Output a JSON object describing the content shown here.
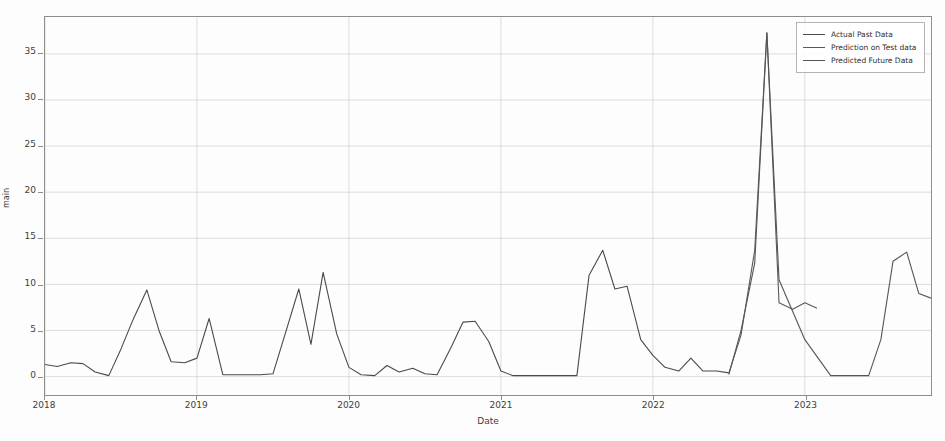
{
  "chart_data": {
    "type": "line",
    "title": "",
    "xlabel": "Date",
    "ylabel": "main",
    "xlim": [
      2018.0,
      2023.83
    ],
    "ylim": [
      -2.0,
      39.0
    ],
    "grid": true,
    "legend_position": "upper right",
    "xticks": [
      {
        "value": 2018,
        "label": "2018"
      },
      {
        "value": 2019,
        "label": "2019"
      },
      {
        "value": 2020,
        "label": "2020"
      },
      {
        "value": 2021,
        "label": "2021"
      },
      {
        "value": 2022,
        "label": "2022"
      },
      {
        "value": 2023,
        "label": "2023"
      }
    ],
    "yticks": [
      {
        "value": 0,
        "label": "0"
      },
      {
        "value": 5,
        "label": "5"
      },
      {
        "value": 10,
        "label": "10"
      },
      {
        "value": 15,
        "label": "15"
      },
      {
        "value": 20,
        "label": "20"
      },
      {
        "value": 25,
        "label": "25"
      },
      {
        "value": 30,
        "label": "30"
      },
      {
        "value": 35,
        "label": "35"
      }
    ],
    "series": [
      {
        "name": "Actual Past Data",
        "color": "#4a4a4a",
        "x": [
          2018.0,
          2018.08,
          2018.17,
          2018.25,
          2018.33,
          2018.42,
          2018.5,
          2018.58,
          2018.67,
          2018.75,
          2018.83,
          2018.92,
          2019.0,
          2019.08,
          2019.17,
          2019.25,
          2019.33,
          2019.42,
          2019.5,
          2019.58,
          2019.67,
          2019.75,
          2019.83,
          2019.92,
          2020.0,
          2020.08,
          2020.17,
          2020.25,
          2020.33,
          2020.42,
          2020.5,
          2020.58,
          2020.67,
          2020.75,
          2020.83,
          2020.92,
          2021.0,
          2021.08,
          2021.17,
          2021.25,
          2021.33,
          2021.42,
          2021.5,
          2021.58,
          2021.67,
          2021.75,
          2021.83,
          2021.92,
          2022.0,
          2022.08,
          2022.17,
          2022.25,
          2022.33,
          2022.42,
          2022.5
        ],
        "y": [
          1.3,
          1.1,
          1.5,
          1.4,
          0.5,
          0.1,
          3.0,
          6.2,
          9.4,
          5.0,
          1.6,
          1.5,
          2.0,
          6.3,
          0.2,
          0.2,
          0.2,
          0.2,
          0.3,
          4.6,
          9.5,
          3.5,
          11.3,
          4.6,
          1.0,
          0.2,
          0.1,
          1.2,
          0.5,
          0.9,
          0.3,
          0.2,
          3.1,
          5.9,
          6.0,
          3.8,
          0.6,
          0.1,
          0.1,
          0.1,
          0.1,
          0.1,
          0.1,
          11.0,
          13.7,
          9.5,
          9.8,
          4.0,
          2.3,
          1.0,
          0.6,
          2.0,
          0.6,
          0.6,
          0.4
        ]
      },
      {
        "name": "Prediction on Test data",
        "color": "#5a5a5a",
        "x": [
          2022.5,
          2022.58,
          2022.67,
          2022.75,
          2022.83,
          2022.92,
          2023.0,
          2023.08
        ],
        "y": [
          0.4,
          4.5,
          13.7,
          37.3,
          8.0,
          7.3,
          8.0,
          7.4
        ]
      },
      {
        "name": "Predicted Future Data",
        "color": "#555555",
        "x": [
          2022.5,
          2022.58,
          2022.67,
          2022.75,
          2022.83,
          2023.0,
          2023.17,
          2023.33,
          2023.42,
          2023.5,
          2023.58,
          2023.67,
          2023.75,
          2023.83
        ],
        "y": [
          0.2,
          5.0,
          12.3,
          37.3,
          10.5,
          4.0,
          0.1,
          0.1,
          0.1,
          4.0,
          12.5,
          13.5,
          9.0,
          8.5
        ]
      }
    ],
    "legend": [
      {
        "label": "Actual Past Data"
      },
      {
        "label": "Prediction on Test data"
      },
      {
        "label": "Predicted Future Data"
      }
    ]
  }
}
